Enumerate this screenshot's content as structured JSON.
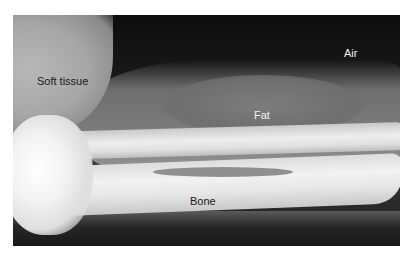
{
  "figure": {
    "labels": {
      "soft_tissue": "Soft tissue",
      "air": "Air",
      "fat": "Fat",
      "bone": "Bone"
    }
  }
}
